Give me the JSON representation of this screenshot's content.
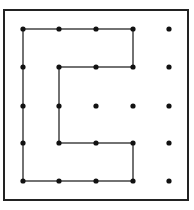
{
  "diagram": {
    "type": "dot-grid-path",
    "grid": {
      "columns": 5,
      "rows": 5
    },
    "colors": {
      "background": "#ffffff",
      "border": "#222222",
      "line": "#444444",
      "dot": "#111111"
    },
    "frame": {
      "x": 4,
      "y": 10,
      "width": 184,
      "height": 190
    },
    "col_x": [
      23,
      59,
      96,
      133,
      169
    ],
    "row_y": [
      29,
      67,
      106,
      143,
      181
    ],
    "path": [
      [
        3,
        1
      ],
      [
        3,
        0
      ],
      [
        0,
        0
      ],
      [
        0,
        4
      ],
      [
        3,
        4
      ],
      [
        3,
        3
      ],
      [
        1,
        3
      ],
      [
        1,
        1
      ],
      [
        3,
        1
      ]
    ],
    "path_note": "Closed polygon shaped like the letter C through grid points (col,row)"
  }
}
